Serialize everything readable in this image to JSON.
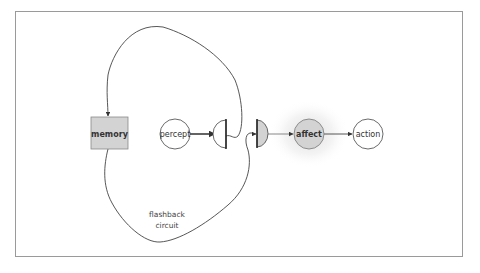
{
  "diagram": {
    "nodes": {
      "memory": {
        "label": "memory",
        "shape": "rectangle",
        "fill": "#d3d3d3"
      },
      "percept": {
        "label": "percept",
        "shape": "circle",
        "fill": "#ffffff"
      },
      "gate_1": {
        "label": "",
        "shape": "half-disc-left",
        "fill": "#ffffff"
      },
      "gate_2": {
        "label": "",
        "shape": "half-disc-right",
        "fill": "#d3d3d3"
      },
      "affect": {
        "label": "affect",
        "shape": "circle",
        "fill": "#d3d3d3",
        "glow": true
      },
      "action": {
        "label": "action",
        "shape": "circle",
        "fill": "#ffffff"
      }
    },
    "edges": [
      {
        "from": "percept",
        "to": "gate_1"
      },
      {
        "from": "gate_1",
        "to": "memory",
        "route": "upper loop"
      },
      {
        "from": "memory",
        "to": "gate_2",
        "route": "lower loop"
      },
      {
        "from": "gate_2",
        "to": "affect"
      },
      {
        "from": "affect",
        "to": "action"
      }
    ],
    "loop_caption": {
      "line1": "flashback",
      "line2": "circuit"
    },
    "colors": {
      "stroke": "#333333",
      "node_gray": "#d3d3d3",
      "frame": "#9a9a9a"
    }
  }
}
